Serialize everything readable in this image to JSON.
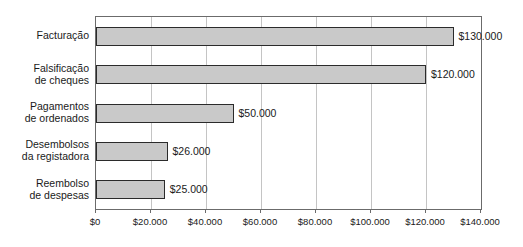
{
  "chart_data": {
    "type": "bar",
    "orientation": "horizontal",
    "title": "",
    "subtitle": "",
    "xlabel": "",
    "ylabel": "",
    "categories": [
      "Facturação",
      "Falsificação\nde cheques",
      "Pagamentos\nde ordenados",
      "Desembolsos\nda registadora",
      "Reembolso\nde despesas"
    ],
    "values": [
      130000,
      120000,
      50000,
      26000,
      25000
    ],
    "data_labels": [
      "$130.000",
      "$120.000",
      "$50.000",
      "$26.000",
      "$25.000"
    ],
    "xlim": [
      0,
      140000
    ],
    "xticks": [
      0,
      20000,
      40000,
      60000,
      80000,
      100000,
      120000,
      140000
    ],
    "xtick_labels": [
      "$0",
      "$20.000",
      "$40.000",
      "$60.000",
      "$80.000",
      "$100.000",
      "$120.000",
      "$140.000"
    ],
    "grid": "vertical",
    "legend": "none",
    "bar_fill_color": "#c9c9c9",
    "bar_border_color": "#2b2b2b",
    "gridline_color": "#c4c4c4",
    "axis_color": "#6b6b6b",
    "text_color": "#1a1a1a",
    "background_color": "#ffffff"
  }
}
